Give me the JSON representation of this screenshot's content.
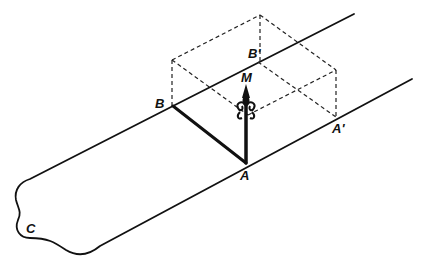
{
  "figure": {
    "labels": {
      "A": "A",
      "A_prime": "A'",
      "B": "B",
      "B_prime": "B'",
      "M": "M",
      "C": "C"
    },
    "colors": {
      "ink": "#111111",
      "background": "#ffffff"
    }
  }
}
